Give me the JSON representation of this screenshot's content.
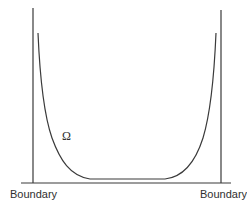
{
  "diagram": {
    "labels": {
      "boundary_left": "Boundary",
      "boundary_right": "Boundary",
      "region": "Ω"
    },
    "colors": {
      "line": "#3a3a3a",
      "text": "#2f2f2f",
      "background": "#ffffff"
    },
    "geometry": {
      "left_wall_x": 33,
      "right_wall_x": 221,
      "baseline_y": 183,
      "curve_floor_y": 179,
      "curve_top_y": 33
    }
  }
}
